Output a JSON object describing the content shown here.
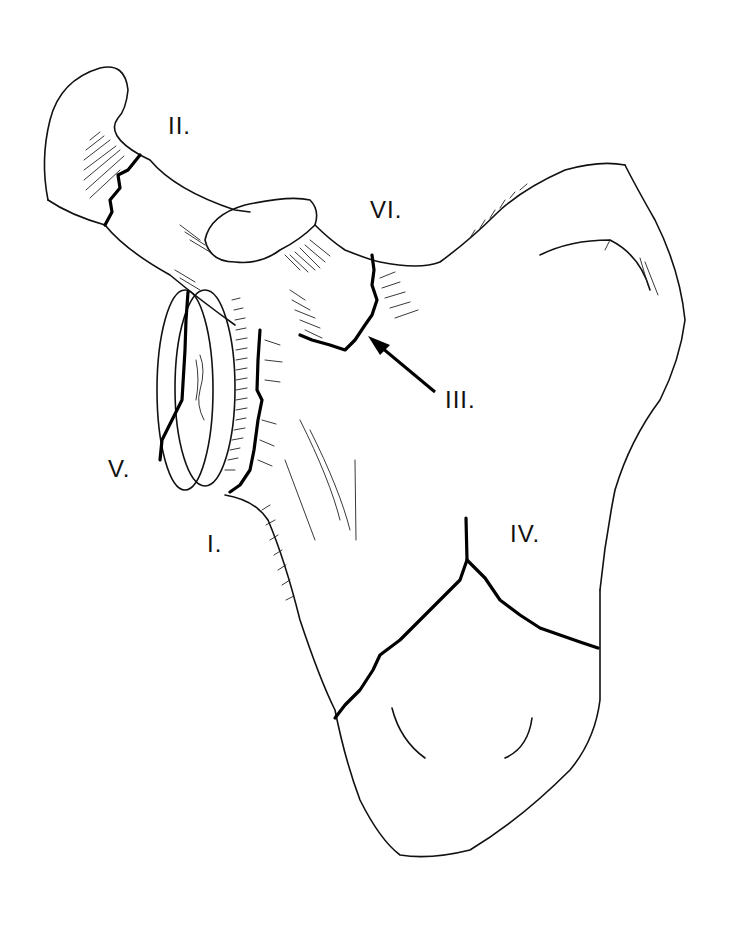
{
  "figure": {
    "line_color": "#111111",
    "background": "#ffffff"
  },
  "labels": {
    "I": "I.",
    "II": "II.",
    "III": "III.",
    "IV": "IV.",
    "V": "V.",
    "VI": "VI."
  }
}
